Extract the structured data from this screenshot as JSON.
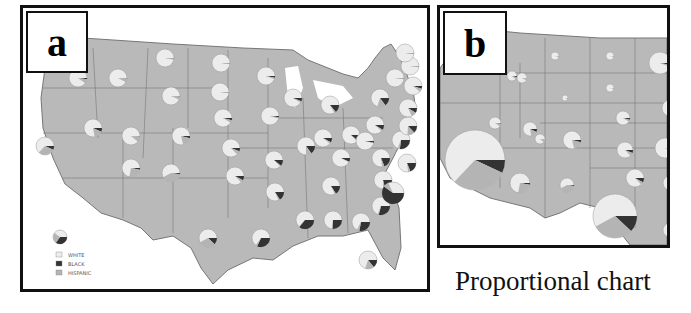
{
  "panels": [
    {
      "id": "a",
      "label": "a"
    },
    {
      "id": "b",
      "label": "b"
    }
  ],
  "caption": "Proportional chart",
  "legend": {
    "items": [
      {
        "label": "WHITE",
        "color": "#ececec"
      },
      {
        "label": "BLACK",
        "color": "#333333"
      },
      {
        "label": "HISPANIC",
        "color": "#b4b4b4"
      }
    ]
  },
  "colors": {
    "land": "#b9b9b9",
    "border": "#777777",
    "white": "#ececec",
    "black": "#333333",
    "hispanic": "#b4b4b4"
  },
  "panel_a_pies": [
    {
      "state": "WA",
      "b": 0.04,
      "h": 0.08
    },
    {
      "state": "OR",
      "b": 0.02,
      "h": 0.08
    },
    {
      "state": "CA",
      "b": 0.07,
      "h": 0.3
    },
    {
      "state": "ID",
      "b": 0.01,
      "h": 0.07
    },
    {
      "state": "NV",
      "b": 0.07,
      "h": 0.15
    },
    {
      "state": "MT",
      "b": 0.01,
      "h": 0.02
    },
    {
      "state": "WY",
      "b": 0.01,
      "h": 0.06
    },
    {
      "state": "UT",
      "b": 0.01,
      "h": 0.1
    },
    {
      "state": "AZ",
      "b": 0.03,
      "h": 0.25
    },
    {
      "state": "CO",
      "b": 0.04,
      "h": 0.17
    },
    {
      "state": "NM",
      "b": 0.02,
      "h": 0.4
    },
    {
      "state": "ND",
      "b": 0.01,
      "h": 0.01
    },
    {
      "state": "SD",
      "b": 0.01,
      "h": 0.01
    },
    {
      "state": "NE",
      "b": 0.04,
      "h": 0.05
    },
    {
      "state": "KS",
      "b": 0.06,
      "h": 0.07
    },
    {
      "state": "OK",
      "b": 0.08,
      "h": 0.05
    },
    {
      "state": "TX",
      "b": 0.12,
      "h": 0.3
    },
    {
      "state": "MN",
      "b": 0.03,
      "h": 0.03
    },
    {
      "state": "IA",
      "b": 0.02,
      "h": 0.03
    },
    {
      "state": "MO",
      "b": 0.11,
      "h": 0.02
    },
    {
      "state": "AR",
      "b": 0.16,
      "h": 0.03
    },
    {
      "state": "LA",
      "b": 0.32,
      "h": 0.03
    },
    {
      "state": "WI",
      "b": 0.06,
      "h": 0.03
    },
    {
      "state": "IL",
      "b": 0.15,
      "h": 0.1
    },
    {
      "state": "MI",
      "b": 0.14,
      "h": 0.03
    },
    {
      "state": "IN",
      "b": 0.08,
      "h": 0.03
    },
    {
      "state": "OH",
      "b": 0.11,
      "h": 0.02
    },
    {
      "state": "KY",
      "b": 0.07,
      "h": 0.01
    },
    {
      "state": "TN",
      "b": 0.16,
      "h": 0.02
    },
    {
      "state": "MS",
      "b": 0.36,
      "h": 0.01
    },
    {
      "state": "AL",
      "b": 0.26,
      "h": 0.01
    },
    {
      "state": "GA",
      "b": 0.28,
      "h": 0.05
    },
    {
      "state": "FL",
      "b": 0.14,
      "h": 0.16
    },
    {
      "state": "SC",
      "b": 0.29,
      "h": 0.02
    },
    {
      "state": "NC",
      "b": 0.21,
      "h": 0.04
    },
    {
      "state": "VA",
      "b": 0.19,
      "h": 0.04
    },
    {
      "state": "WV",
      "b": 0.03,
      "h": 0.01
    },
    {
      "state": "PA",
      "b": 0.09,
      "h": 0.03
    },
    {
      "state": "NY",
      "b": 0.15,
      "h": 0.15
    },
    {
      "state": "MD",
      "b": 0.27,
      "h": 0.04
    },
    {
      "state": "DE",
      "b": 0.19,
      "h": 0.04
    },
    {
      "state": "NJ",
      "b": 0.13,
      "h": 0.13
    },
    {
      "state": "CT",
      "b": 0.09,
      "h": 0.09
    },
    {
      "state": "MA",
      "b": 0.05,
      "h": 0.06
    },
    {
      "state": "VT",
      "b": 0.01,
      "h": 0.01
    },
    {
      "state": "NH",
      "b": 0.01,
      "h": 0.01
    },
    {
      "state": "ME",
      "b": 0.01,
      "h": 0.01
    },
    {
      "state": "DC",
      "b": 0.6,
      "h": 0.08
    }
  ],
  "panel_b_pies": [
    {
      "state": "WA",
      "b": 0.04,
      "h": 0.08
    },
    {
      "state": "MT",
      "b": 0.01,
      "h": 0.02
    },
    {
      "state": "ND",
      "b": 0.01,
      "h": 0.01
    },
    {
      "state": "MN",
      "b": 0.03,
      "h": 0.03
    },
    {
      "state": "ID",
      "b": 0.01,
      "h": 0.07
    },
    {
      "state": "WY",
      "b": 0.01,
      "h": 0.06
    },
    {
      "state": "SD",
      "b": 0.01,
      "h": 0.01
    },
    {
      "state": "WI",
      "b": 0.06,
      "h": 0.03
    },
    {
      "state": "OR",
      "b": 0.02,
      "h": 0.08
    },
    {
      "state": "NV",
      "b": 0.07,
      "h": 0.15
    },
    {
      "state": "UT",
      "b": 0.01,
      "h": 0.1
    },
    {
      "state": "CO",
      "b": 0.04,
      "h": 0.17
    },
    {
      "state": "NE",
      "b": 0.04,
      "h": 0.05
    },
    {
      "state": "IA",
      "b": 0.02,
      "h": 0.03
    },
    {
      "state": "CA",
      "b": 0.07,
      "h": 0.3
    },
    {
      "state": "AZ",
      "b": 0.03,
      "h": 0.25
    },
    {
      "state": "NM",
      "b": 0.02,
      "h": 0.4
    },
    {
      "state": "KS",
      "b": 0.06,
      "h": 0.07
    },
    {
      "state": "OK",
      "b": 0.08,
      "h": 0.05
    },
    {
      "state": "TX",
      "b": 0.12,
      "h": 0.3
    },
    {
      "state": "MO",
      "b": 0.11,
      "h": 0.02
    },
    {
      "state": "AR",
      "b": 0.16,
      "h": 0.03
    }
  ]
}
